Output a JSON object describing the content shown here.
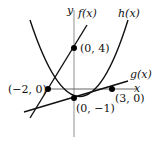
{
  "diagram": {
    "axes": {
      "x_label": "x",
      "y_label": "y"
    },
    "curves": [
      {
        "id": "f",
        "label": "f(x)",
        "type": "line",
        "through": [
          [
            -2,
            0
          ],
          [
            0,
            4
          ]
        ]
      },
      {
        "id": "g",
        "label": "g(x)",
        "type": "line",
        "through": [
          [
            0,
            -1
          ],
          [
            3,
            0
          ]
        ]
      },
      {
        "id": "h",
        "label": "h(x)",
        "type": "parabola",
        "roots": [
          -2,
          3
        ]
      }
    ],
    "points": [
      {
        "id": "p1",
        "label": "(0, 4)"
      },
      {
        "id": "p2",
        "label": "(−2, 0)"
      },
      {
        "id": "p3",
        "label": "(3, 0)"
      },
      {
        "id": "p4",
        "label": "(0, −1)"
      }
    ],
    "colors": {
      "axis": "#999999",
      "curve": "#111111",
      "point": "#000000"
    }
  }
}
